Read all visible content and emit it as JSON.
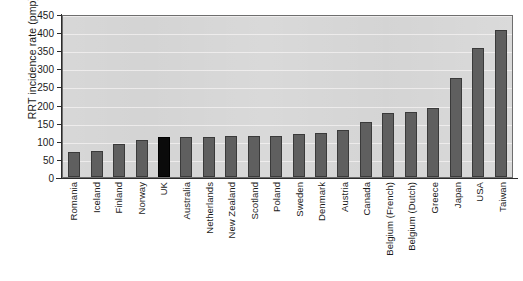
{
  "chart_data": {
    "type": "bar",
    "title": "",
    "xlabel": "",
    "ylabel": "RRT incidence rate (pmp)",
    "ylim": [
      0,
      450
    ],
    "yticks": [
      0,
      50,
      100,
      150,
      200,
      250,
      300,
      350,
      400,
      450
    ],
    "grid": true,
    "legend": "none",
    "highlight_category": "UK",
    "highlight_color": "#0b0b0b",
    "bar_color": "#5f5f5f",
    "plot_background": "#d3d3d3",
    "categories": [
      "Romania",
      "Iceland",
      "Finland",
      "Norway",
      "UK",
      "Australia",
      "Netherlands",
      "New Zealand",
      "Scotland",
      "Poland",
      "Sweden",
      "Denmark",
      "Austria",
      "Canada",
      "Belgium (French)",
      "Belgium (Dutch)",
      "Greece",
      "Japan",
      "USA",
      "Taiwan"
    ],
    "values": [
      70,
      72,
      92,
      103,
      110,
      111,
      111,
      112,
      112,
      113,
      118,
      122,
      130,
      152,
      178,
      180,
      190,
      272,
      355,
      405
    ]
  }
}
